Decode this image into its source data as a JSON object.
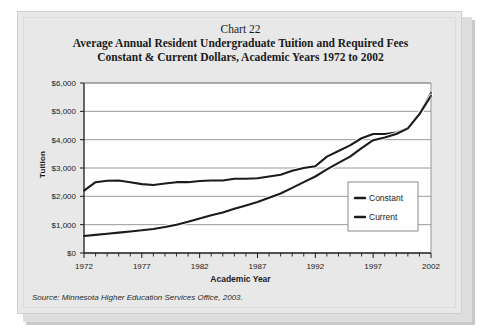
{
  "card": {
    "background_color": "#e8e8e8",
    "border_color": "#cfcfcf"
  },
  "titles": {
    "chart_number": "Chart 22",
    "line1": "Average Annual Resident Undergraduate Tuition and Required Fees",
    "line2": "Constant & Current Dollars, Academic Years 1972 to 2002"
  },
  "source": {
    "text": "Source: Minnesota Higher Education Services Office, 2003."
  },
  "axes": {
    "y_label": "Tuition",
    "x_label": "Academic Year",
    "y_ticks": [
      "$0",
      "$1,000",
      "$2,000",
      "$3,000",
      "$4,000",
      "$5,000",
      "$6,000"
    ],
    "x_ticks": [
      "1972",
      "1977",
      "1982",
      "1987",
      "1992",
      "1997",
      "2002"
    ]
  },
  "legend": {
    "position": "inside-bottom-right",
    "items": [
      {
        "label": "Constant",
        "color": "#1b1b1b"
      },
      {
        "label": "Current",
        "color": "#1b1b1b"
      }
    ]
  },
  "chart_data": {
    "type": "line",
    "title": "Average Annual Resident Undergraduate Tuition and Required Fees",
    "subtitle": "Constant & Current Dollars, Academic Years 1972 to 2002",
    "xlabel": "Academic Year",
    "ylabel": "Tuition",
    "xlim": [
      1972,
      2002
    ],
    "ylim": [
      0,
      6000
    ],
    "ytick_step": 1000,
    "xtick_step": 5,
    "minor_xticks": 1,
    "grid": "horizontal",
    "legend_position": "inside-bottom-right",
    "x": [
      1972,
      1973,
      1974,
      1975,
      1976,
      1977,
      1978,
      1979,
      1980,
      1981,
      1982,
      1983,
      1984,
      1985,
      1986,
      1987,
      1988,
      1989,
      1990,
      1991,
      1992,
      1993,
      1994,
      1995,
      1996,
      1997,
      1998,
      1999,
      2000,
      2001,
      2002
    ],
    "series": [
      {
        "name": "Constant",
        "color": "#1b1b1b",
        "values": [
          2200,
          2500,
          2550,
          2560,
          2500,
          2430,
          2400,
          2450,
          2500,
          2500,
          2540,
          2560,
          2560,
          2620,
          2620,
          2640,
          2700,
          2760,
          2900,
          3000,
          3060,
          3400,
          3600,
          3800,
          4050,
          4200,
          4200,
          4250,
          4400,
          4900,
          5650
        ]
      },
      {
        "name": "Current",
        "color": "#1b1b1b",
        "values": [
          600,
          640,
          680,
          720,
          760,
          800,
          850,
          920,
          1000,
          1100,
          1220,
          1330,
          1430,
          1560,
          1680,
          1800,
          1950,
          2100,
          2300,
          2500,
          2700,
          2950,
          3180,
          3400,
          3700,
          3980,
          4080,
          4200,
          4400,
          4900,
          5550
        ]
      }
    ]
  }
}
